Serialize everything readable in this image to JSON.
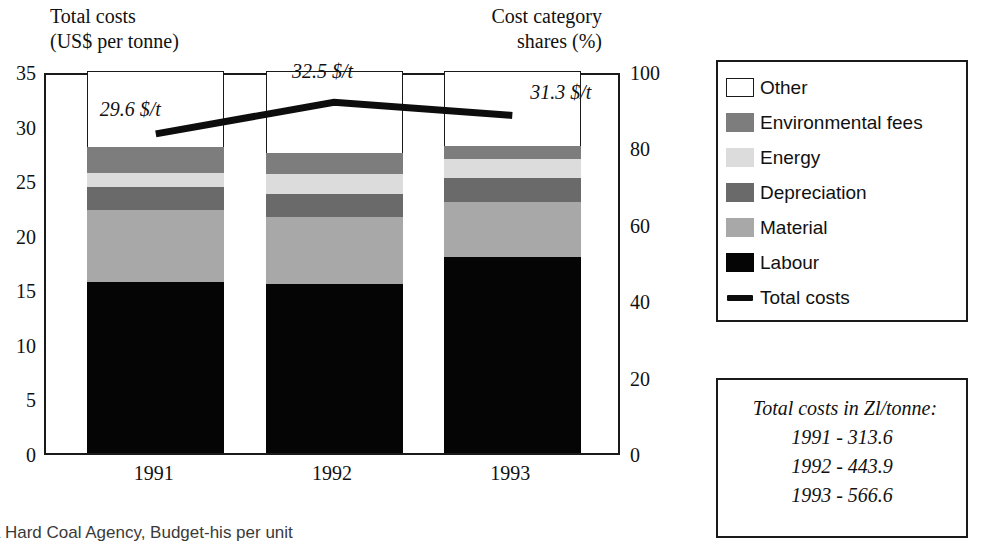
{
  "titles": {
    "left": "Total costs\n(US$ per tonne)",
    "right": "Cost category\nshares (%)"
  },
  "source_caption": "ta Hard Coal Agency, Budget-his per unit",
  "legend": {
    "items": [
      {
        "label": "Other",
        "swatch": "other-swatch",
        "color": "#ffffff"
      },
      {
        "label": "Environmental fees",
        "swatch": "environmental-fees-swatch",
        "color": "#7d7d7d"
      },
      {
        "label": "Energy",
        "swatch": "energy-swatch",
        "color": "#dcdcdc"
      },
      {
        "label": "Depreciation",
        "swatch": "depreciation-swatch",
        "color": "#6a6a6a"
      },
      {
        "label": "Material",
        "swatch": "material-swatch",
        "color": "#a8a8a8"
      },
      {
        "label": "Labour",
        "swatch": "labour-swatch",
        "color": "#050505"
      },
      {
        "label": "Total costs",
        "swatch": "total-costs-line-swatch",
        "color": "#0d0d0d"
      }
    ]
  },
  "note_box": {
    "heading": "Total costs in Zl/tonne:",
    "lines": [
      "1991 - 313.6",
      "1992 - 443.9",
      "1993 - 566.6"
    ]
  },
  "chart_data": {
    "type": "bar",
    "subtype": "stacked-bar-with-line-overlay",
    "xlabel": "",
    "ylabel": "Total costs (US$ per tonne)",
    "y2label": "Cost category shares (%)",
    "categories": [
      "1991",
      "1992",
      "1993"
    ],
    "ylim": [
      0,
      35
    ],
    "yticks": [
      0,
      5,
      10,
      15,
      20,
      25,
      30,
      35
    ],
    "y2lim": [
      0,
      100
    ],
    "y2ticks": [
      0,
      20,
      40,
      60,
      80,
      100
    ],
    "grid": false,
    "legend_position": "right",
    "stack_order_bottom_to_top": [
      "Labour",
      "Material",
      "Depreciation",
      "Energy",
      "Environmental fees",
      "Other"
    ],
    "series": [
      {
        "name": "Labour",
        "color": "#050505",
        "values": [
          15.7,
          15.5,
          18.0
        ]
      },
      {
        "name": "Material",
        "color": "#a8a8a8",
        "values": [
          6.6,
          6.1,
          5.0
        ]
      },
      {
        "name": "Depreciation",
        "color": "#6a6a6a",
        "values": [
          2.1,
          2.1,
          2.2
        ]
      },
      {
        "name": "Energy",
        "color": "#dcdcdc",
        "values": [
          1.3,
          1.9,
          1.7
        ]
      },
      {
        "name": "Environmental fees",
        "color": "#7d7d7d",
        "values": [
          2.3,
          1.9,
          1.2
        ]
      },
      {
        "name": "Other",
        "color": "#ffffff",
        "values": [
          7.0,
          7.5,
          6.9
        ]
      }
    ],
    "line_series": {
      "name": "Total costs",
      "color": "#0d0d0d",
      "unit": "$/t",
      "values": [
        29.6,
        32.5,
        31.3
      ],
      "point_labels": [
        "29.6 $/t",
        "32.5 $/t",
        "31.3 $/t"
      ]
    },
    "annotations": [
      {
        "text": "Total costs in Zl/tonne: 1991 - 313.6, 1992 - 443.9, 1993 - 566.6"
      }
    ]
  }
}
